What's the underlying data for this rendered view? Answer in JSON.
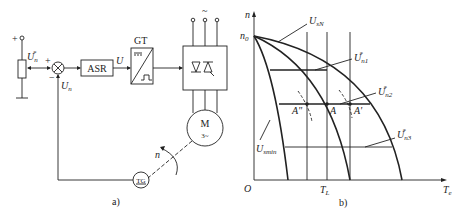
{
  "diagram_a": {
    "caption": "a)",
    "reference": {
      "symbol": "U",
      "sub": "n",
      "sup": "*",
      "plus": "+"
    },
    "summer": {
      "plus": "+",
      "minus": "−"
    },
    "feedback": {
      "symbol": "U",
      "sub": "n"
    },
    "asr": {
      "label": "ASR"
    },
    "asr_output": {
      "symbol": "U"
    },
    "gt": {
      "label": "GT"
    },
    "supply": {
      "symbol": "~"
    },
    "motor": {
      "label": "M",
      "sub": "3~"
    },
    "tachogen": {
      "label": "TG"
    },
    "speed": {
      "symbol": "n"
    }
  },
  "diagram_b": {
    "caption": "b)",
    "y_axis": {
      "symbol": "n"
    },
    "x_axis": {
      "symbol": "T",
      "sub": "e"
    },
    "origin": "O",
    "n0": {
      "symbol": "n",
      "sub": "0"
    },
    "tl": {
      "symbol": "T",
      "sub": "L"
    },
    "curves": [
      {
        "symbol": "U",
        "sub": "sN"
      },
      {
        "symbol": "U",
        "sub": "smin"
      }
    ],
    "setpoints": [
      {
        "symbol": "U",
        "sub": "n1",
        "sup": "*"
      },
      {
        "symbol": "U",
        "sub": "n2",
        "sup": "*"
      },
      {
        "symbol": "U",
        "sub": "n3",
        "sup": "*"
      }
    ],
    "points": [
      {
        "label": "A\""
      },
      {
        "label": "A"
      },
      {
        "label": "A'"
      }
    ]
  },
  "colors": {
    "ink": "#222222",
    "background": "#ffffff"
  }
}
